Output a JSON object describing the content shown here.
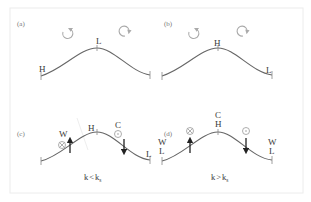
{
  "figure": {
    "frame_color": "#ececec",
    "curve_color": "#666666",
    "panels": [
      {
        "id": "a",
        "tag": "(a)",
        "left_label": "H",
        "peak_label": "L",
        "right_label": "",
        "rotations": [
          "counterclockwise",
          "clockwise"
        ]
      },
      {
        "id": "b",
        "tag": "(b)",
        "left_label": "",
        "peak_label": "H",
        "right_label": "L",
        "rotations": [
          "counterclockwise",
          "clockwise"
        ]
      },
      {
        "id": "c",
        "tag": "(c)",
        "left_label": "",
        "upslope_label": "W",
        "peak_label": "H",
        "downslope_label": "C",
        "right_label": "L",
        "upslope_symbol": "into-page (⊗)",
        "downslope_symbol": "out-of-page (⊙)",
        "condition": {
          "k": "k",
          "op": "<",
          "ks": "k",
          "sub": "s"
        }
      },
      {
        "id": "d",
        "tag": "(d)",
        "left_label_top": "W",
        "left_label_bottom": "L",
        "peak_label_top": "C",
        "peak_label_bottom": "H",
        "right_label_top": "W",
        "right_label_bottom": "L",
        "upslope_symbol": "into-page (⊗)",
        "downslope_symbol": "out-of-page (⊙)",
        "condition": {
          "k": "k",
          "op": ">",
          "ks": "k",
          "sub": "s"
        }
      }
    ]
  }
}
